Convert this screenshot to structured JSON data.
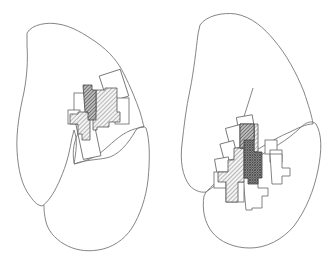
{
  "figure": {
    "panels": [
      {
        "id": "left",
        "description": "Organ outline (two lobes) with overlapping hatched rectangular lesion/activation regions in upper-right area"
      },
      {
        "id": "right",
        "description": "Organ outline (two lobes) with overlapping hatched and cross-hatched rectangular regions in lower-center area"
      }
    ],
    "colors": {
      "outline": "#777777",
      "hatch_light": "#888888",
      "hatch_dark": "#444444",
      "background": "#ffffff"
    }
  }
}
